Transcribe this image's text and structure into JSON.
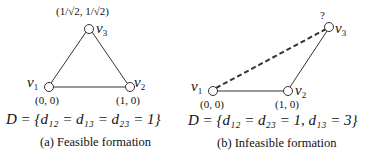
{
  "panels": [
    {
      "id": "a",
      "caption": "(a) Feasible formation",
      "equation": "D = {d₁₂ = d₁₃ = d₂₃ = 1}",
      "nodes": [
        {
          "label": "v1",
          "coord": "(0, 0)"
        },
        {
          "label": "v2",
          "coord": "(1, 0)"
        },
        {
          "label": "v3",
          "coord": "(1/√2, 1/√2)"
        }
      ],
      "edges": [
        {
          "from": "v1",
          "to": "v2",
          "style": "solid"
        },
        {
          "from": "v1",
          "to": "v3",
          "style": "solid"
        },
        {
          "from": "v2",
          "to": "v3",
          "style": "solid"
        }
      ]
    },
    {
      "id": "b",
      "caption": "(b) Infeasible formation",
      "equation": "D = {d₁₂ = d₂₃ = 1,  d₁₃ = 3}",
      "unknown_marker": "?",
      "nodes": [
        {
          "label": "v1",
          "coord": "(0, 0)"
        },
        {
          "label": "v2",
          "coord": "(1, 0)"
        },
        {
          "label": "v3",
          "coord": ""
        }
      ],
      "edges": [
        {
          "from": "v1",
          "to": "v2",
          "style": "solid"
        },
        {
          "from": "v2",
          "to": "v3",
          "style": "solid"
        },
        {
          "from": "v1",
          "to": "v3",
          "style": "dashed"
        }
      ]
    }
  ]
}
